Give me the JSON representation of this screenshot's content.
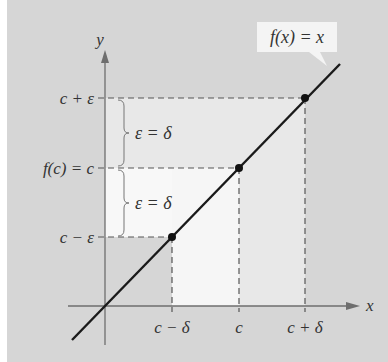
{
  "figure": {
    "function_label": "f(x) = x",
    "axes": {
      "x_label": "x",
      "y_label": "y"
    },
    "x_ticks": [
      "c − δ",
      "c",
      "c + δ"
    ],
    "y_ticks": [
      "c + ε",
      "f(c) = c",
      "c − ε"
    ],
    "brace_labels": [
      "ε = δ",
      "ε = δ"
    ],
    "colors": {
      "background": "#d6d6d6",
      "highlight": "#f2f2f2",
      "highlight_light": "#e6e6e6",
      "line": "#1a1a1a",
      "axis": "#6e6e6e",
      "dashed": "#555555"
    }
  }
}
